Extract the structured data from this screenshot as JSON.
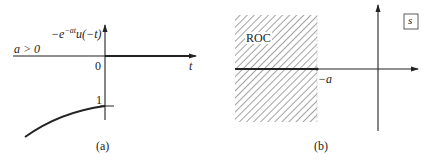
{
  "panel_a": {
    "y_label": "−e",
    "y_label_exp": "−at",
    "y_label_rest": "u(−t)",
    "condition": "a > 0",
    "origin_label": "0",
    "x_axis_label": "t",
    "tick_label": "1",
    "caption": "(a)"
  },
  "panel_b": {
    "region_label": "ROC",
    "pole_label": "−a",
    "plane_label": "s",
    "caption": "(b)"
  }
}
